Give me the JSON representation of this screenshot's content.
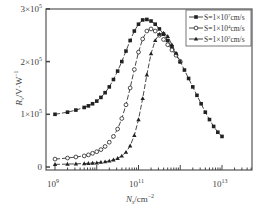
{
  "chart_data": {
    "type": "line",
    "title": "",
    "xlabel": "N_s/cm^-2",
    "ylabel": "R_v/V·W^-1",
    "xscale": "log",
    "xlim": [
      1000000000.0,
      30000000000000.0
    ],
    "ylim": [
      -10000.0,
      300000.0
    ],
    "x_ticks": [
      {
        "value": 1000000000.0,
        "label_base": "10",
        "label_exp": "9"
      },
      {
        "value": 100000000000.0,
        "label_base": "10",
        "label_exp": "11"
      },
      {
        "value": 10000000000000.0,
        "label_base": "10",
        "label_exp": "13"
      }
    ],
    "y_ticks": [
      {
        "value": 0,
        "label": "0",
        "exp": ""
      },
      {
        "value": 100000,
        "label": "1×10",
        "exp": "5"
      },
      {
        "value": 200000,
        "label": "2×10",
        "exp": "5"
      },
      {
        "value": 300000,
        "label": "3×10",
        "exp": "5"
      }
    ],
    "grid": false,
    "legend_position": "upper right",
    "series": [
      {
        "name": "S=1×10^7cm/s",
        "legend_label": "S=1×10",
        "legend_exp": "7",
        "legend_unit": "cm/s",
        "marker": "filled-square",
        "x_log10": [
          9.0,
          9.3,
          9.5,
          9.7,
          9.8,
          9.9,
          10.0,
          10.1,
          10.2,
          10.3,
          10.4,
          10.5,
          10.6,
          10.7,
          10.8,
          10.9,
          11.0,
          11.1,
          11.2,
          11.3,
          11.4,
          11.5,
          11.6,
          11.7,
          11.8,
          11.9,
          12.0,
          12.1,
          12.2,
          12.3,
          12.4,
          12.5,
          12.6,
          12.7,
          12.8,
          12.9,
          13.0
        ],
        "y": [
          100000,
          104000,
          108000,
          113000,
          116000,
          120000,
          125000,
          132000,
          141000,
          152000,
          166000,
          182000,
          200000,
          220000,
          240000,
          258000,
          271000,
          279000,
          280000,
          277000,
          271000,
          262000,
          252000,
          240000,
          228000,
          214000,
          200000,
          184000,
          168000,
          152000,
          136000,
          120000,
          104000,
          90000,
          77000,
          66000,
          58000
        ]
      },
      {
        "name": "S=1×10^4cm/s",
        "legend_label": "S=1×10",
        "legend_exp": "4",
        "legend_unit": "cm/s",
        "marker": "open-circle",
        "x_log10": [
          9.0,
          9.3,
          9.5,
          9.7,
          9.8,
          9.9,
          10.0,
          10.1,
          10.2,
          10.3,
          10.4,
          10.5,
          10.6,
          10.7,
          10.8,
          10.9,
          11.0,
          11.1,
          11.2,
          11.3,
          11.4,
          11.5,
          11.6,
          11.7,
          11.8,
          11.9,
          12.0
        ],
        "y": [
          15000,
          17000,
          19000,
          21000,
          23000,
          26000,
          29000,
          33000,
          39000,
          47000,
          58000,
          72000,
          92000,
          118000,
          150000,
          185000,
          218000,
          243000,
          258000,
          262000,
          258000,
          250000,
          242000,
          232000,
          222000,
          212000,
          200000
        ]
      },
      {
        "name": "S=1×10^2cm/s",
        "legend_label": "S=1×10",
        "legend_exp": "2",
        "legend_unit": "cm/s",
        "marker": "filled-triangle",
        "x_log10": [
          9.0,
          9.3,
          9.5,
          9.7,
          9.8,
          9.9,
          10.0,
          10.1,
          10.2,
          10.3,
          10.4,
          10.5,
          10.6,
          10.7,
          10.8,
          10.9,
          11.0,
          11.1,
          11.2,
          11.3,
          11.4,
          11.5,
          11.6,
          11.7,
          11.8,
          11.9,
          12.0
        ],
        "y": [
          5000,
          5500,
          6000,
          6500,
          7000,
          7500,
          8000,
          9000,
          10000,
          11500,
          13500,
          16500,
          21000,
          28000,
          40000,
          60000,
          90000,
          130000,
          175000,
          215000,
          240000,
          252000,
          254000,
          248000,
          232000,
          216000,
          200000
        ]
      }
    ]
  }
}
